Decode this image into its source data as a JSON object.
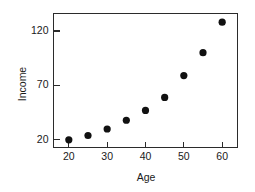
{
  "chart_data": {
    "type": "scatter",
    "title": "",
    "xlabel": "Age",
    "ylabel": "Income",
    "xlim": [
      16,
      64
    ],
    "ylim": [
      13,
      136
    ],
    "grid": false,
    "legend": null,
    "xticks": [
      20,
      30,
      40,
      50,
      60
    ],
    "xtick_labels": [
      "20",
      "30",
      "40",
      "50",
      "60"
    ],
    "yticks": [
      20,
      70,
      120
    ],
    "ytick_labels": [
      "20",
      "70",
      "120"
    ],
    "marker": "filled-circle",
    "marker_color": "#111111",
    "frame_color": "#2b2b2b",
    "x": [
      20,
      25,
      30,
      35,
      40,
      45,
      50,
      55,
      60
    ],
    "values": [
      20,
      24,
      30,
      38,
      47,
      59,
      79,
      100,
      128
    ],
    "points": [
      {
        "x": 20,
        "y": 20
      },
      {
        "x": 25,
        "y": 24
      },
      {
        "x": 30,
        "y": 30
      },
      {
        "x": 35,
        "y": 38
      },
      {
        "x": 40,
        "y": 47
      },
      {
        "x": 45,
        "y": 59
      },
      {
        "x": 50,
        "y": 79
      },
      {
        "x": 55,
        "y": 100
      },
      {
        "x": 60,
        "y": 128
      }
    ]
  }
}
